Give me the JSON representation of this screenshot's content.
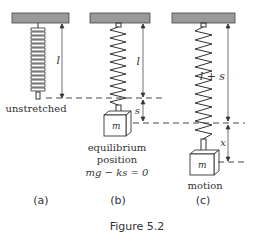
{
  "figure": {
    "caption": "Figure 5.2",
    "panels": [
      {
        "id": "a",
        "tag": "(a)",
        "label": "unstretched",
        "length_label": "l"
      },
      {
        "id": "b",
        "tag": "(b)",
        "label_line1": "equilibrium",
        "label_line2": "position",
        "equation": "mg − ks = 0",
        "length_label": "l",
        "stretch_label": "s",
        "mass_label": "m"
      },
      {
        "id": "c",
        "tag": "(c)",
        "label": "motion",
        "length_label": "l + s",
        "displacement_label": "x",
        "mass_label": "m"
      }
    ],
    "colors": {
      "ceiling": "#9a9a9a",
      "line": "#333333"
    }
  }
}
